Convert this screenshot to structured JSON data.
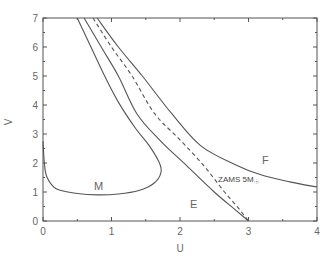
{
  "chart_data": {
    "type": "line",
    "title": "",
    "xlabel": "U",
    "ylabel": "V",
    "xlim": [
      0,
      4
    ],
    "ylim": [
      0,
      7
    ],
    "xticks": [
      0,
      1,
      2,
      3,
      4
    ],
    "yticks": [
      0,
      1,
      2,
      3,
      4,
      5,
      6,
      7
    ],
    "grid": false,
    "legend": "none",
    "series": [
      {
        "name": "M",
        "style": "solid",
        "points": [
          [
            0.0,
            2.75
          ],
          [
            0.02,
            2.0
          ],
          [
            0.06,
            1.5
          ],
          [
            0.2,
            1.1
          ],
          [
            0.5,
            0.95
          ],
          [
            0.8,
            0.9
          ],
          [
            1.1,
            0.93
          ],
          [
            1.4,
            1.05
          ],
          [
            1.62,
            1.3
          ],
          [
            1.72,
            1.65
          ],
          [
            1.7,
            2.0
          ],
          [
            1.55,
            2.6
          ],
          [
            1.35,
            3.2
          ],
          [
            1.1,
            4.1
          ],
          [
            0.9,
            5.0
          ],
          [
            0.7,
            6.0
          ],
          [
            0.5,
            7.0
          ]
        ]
      },
      {
        "name": "E",
        "style": "solid",
        "points": [
          [
            0.6,
            7.0
          ],
          [
            0.85,
            6.0
          ],
          [
            1.1,
            5.0
          ],
          [
            1.37,
            3.7
          ],
          [
            1.7,
            2.8
          ],
          [
            2.1,
            1.9
          ],
          [
            2.5,
            1.0
          ],
          [
            2.8,
            0.4
          ],
          [
            3.0,
            0.0
          ]
        ]
      },
      {
        "name": "ZAMS 5M☉",
        "style": "dashed",
        "points": [
          [
            0.73,
            7.0
          ],
          [
            1.0,
            6.0
          ],
          [
            1.3,
            5.0
          ],
          [
            1.63,
            3.7
          ],
          [
            2.0,
            2.8
          ],
          [
            2.35,
            1.9
          ],
          [
            2.65,
            1.0
          ],
          [
            2.85,
            0.45
          ],
          [
            3.0,
            0.0
          ]
        ]
      },
      {
        "name": "F",
        "style": "solid",
        "points": [
          [
            0.79,
            7.0
          ],
          [
            1.1,
            6.0
          ],
          [
            1.45,
            5.0
          ],
          [
            1.88,
            3.7
          ],
          [
            2.3,
            2.6
          ],
          [
            2.8,
            1.95
          ],
          [
            3.17,
            1.6
          ],
          [
            3.6,
            1.35
          ],
          [
            4.0,
            1.17
          ]
        ]
      }
    ],
    "annotations": [
      {
        "text": "M",
        "x": 0.75,
        "y": 1.05
      },
      {
        "text": "E",
        "x": 2.15,
        "y": 0.45
      },
      {
        "text": "F",
        "x": 3.5,
        "y": 1.85
      },
      {
        "text": "ZAMS 5M☉",
        "x": 2.55,
        "y": 1.4
      }
    ]
  },
  "labels": {
    "xlabel": "U",
    "ylabel": "V",
    "m": "M",
    "e": "E",
    "f": "F",
    "zams": "ZAMS 5M",
    "sun": "☉"
  }
}
